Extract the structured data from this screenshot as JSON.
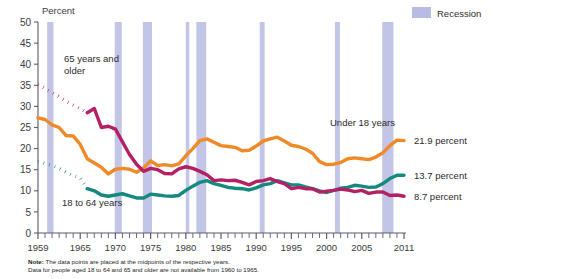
{
  "axis": {
    "ylabel": "Percent",
    "yticks": [
      "0",
      "5",
      "10",
      "15",
      "20",
      "25",
      "30",
      "35",
      "40",
      "45",
      "50"
    ],
    "xticks": [
      "1959",
      "1965",
      "1970",
      "1975",
      "1980",
      "1985",
      "1990",
      "1995",
      "2000",
      "2005",
      "2011"
    ],
    "ylim": [
      0,
      50
    ],
    "xlim": [
      1959,
      2011
    ]
  },
  "legend": {
    "recession_label": "Recession",
    "recession_color": "#b9bbe2"
  },
  "series_labels": {
    "older": "65 years and\nolder",
    "older_line1": "65 years and",
    "older_line2": "older",
    "under18": "Under 18 years",
    "adults": "18 to 64 years"
  },
  "end_values": {
    "under18": "21.9 percent",
    "adults": "13.7 percent",
    "older": "8.7 percent"
  },
  "colors": {
    "under18": "#f08a26",
    "adults": "#14897f",
    "older": "#b32064",
    "recession": "#b9bbe2",
    "axis": "#5a5a6e"
  },
  "note": {
    "label": "Note:",
    "line1": "The data  points are  placed  at the midpoints of the respective years.",
    "line2": "Data for people aged 18 to 64 and 65 and older are not available from 1960 to 1965."
  },
  "chart_data": {
    "type": "line",
    "title": "",
    "xlabel": "",
    "ylabel": "Percent",
    "ylim": [
      0,
      50
    ],
    "xlim": [
      1959,
      2011
    ],
    "grid": false,
    "legend_position": "top-right",
    "x": [
      1959,
      1960,
      1961,
      1962,
      1963,
      1964,
      1965,
      1966,
      1967,
      1968,
      1969,
      1970,
      1971,
      1972,
      1973,
      1974,
      1975,
      1976,
      1977,
      1978,
      1979,
      1980,
      1981,
      1982,
      1983,
      1984,
      1985,
      1986,
      1987,
      1988,
      1989,
      1990,
      1991,
      1992,
      1993,
      1994,
      1995,
      1996,
      1997,
      1998,
      1999,
      2000,
      2001,
      2002,
      2003,
      2004,
      2005,
      2006,
      2007,
      2008,
      2009,
      2010,
      2011
    ],
    "series": [
      {
        "name": "Under 18 years",
        "color": "#f08a26",
        "style": "solid",
        "values": [
          27.3,
          26.9,
          25.6,
          25.0,
          23.1,
          23.0,
          21.0,
          17.6,
          16.6,
          15.6,
          14.0,
          15.1,
          15.3,
          15.1,
          14.4,
          15.4,
          17.1,
          16.0,
          16.2,
          15.9,
          16.4,
          18.3,
          20.0,
          21.9,
          22.3,
          21.5,
          20.7,
          20.5,
          20.3,
          19.5,
          19.6,
          20.6,
          21.8,
          22.3,
          22.7,
          21.8,
          20.8,
          20.5,
          19.9,
          18.9,
          16.9,
          16.2,
          16.3,
          16.7,
          17.6,
          17.8,
          17.6,
          17.4,
          18.0,
          19.0,
          20.7,
          22.0,
          21.9
        ]
      },
      {
        "name": "18 to 64 years",
        "color": "#14897f",
        "style": "dotted-then-solid",
        "dotted_range": [
          1959,
          1966
        ],
        "values": [
          17.0,
          16.5,
          16.0,
          15.3,
          14.4,
          13.6,
          13.1,
          10.5,
          10.0,
          9.0,
          8.7,
          9.0,
          9.3,
          8.8,
          8.3,
          8.3,
          9.2,
          9.0,
          8.8,
          8.7,
          8.9,
          10.1,
          11.1,
          12.0,
          12.4,
          11.7,
          11.3,
          10.8,
          10.6,
          10.5,
          10.2,
          10.7,
          11.4,
          11.7,
          12.4,
          11.9,
          11.4,
          11.4,
          10.9,
          10.5,
          10.0,
          9.6,
          10.1,
          10.6,
          10.8,
          11.3,
          11.1,
          10.8,
          10.9,
          11.7,
          12.9,
          13.7,
          13.7
        ]
      },
      {
        "name": "65 years and older",
        "color": "#b32064",
        "style": "dotted-then-solid",
        "dotted_range": [
          1959,
          1966
        ],
        "values": [
          35.2,
          34.3,
          33.3,
          32.3,
          31.2,
          30.3,
          29.5,
          28.5,
          29.5,
          25.0,
          25.3,
          24.6,
          21.6,
          18.6,
          16.3,
          14.6,
          15.3,
          15.0,
          14.1,
          14.0,
          15.2,
          15.7,
          15.3,
          14.6,
          13.8,
          12.4,
          12.6,
          12.4,
          12.5,
          12.0,
          11.4,
          12.2,
          12.4,
          12.9,
          12.2,
          11.7,
          10.5,
          10.8,
          10.5,
          10.5,
          9.7,
          9.9,
          10.1,
          10.4,
          10.2,
          9.8,
          10.1,
          9.4,
          9.7,
          9.7,
          8.9,
          9.0,
          8.7
        ]
      }
    ],
    "recessions": [
      {
        "start": 1960.3,
        "end": 1961.2
      },
      {
        "start": 1969.9,
        "end": 1970.9
      },
      {
        "start": 1973.9,
        "end": 1975.2
      },
      {
        "start": 1980.0,
        "end": 1980.5
      },
      {
        "start": 1981.5,
        "end": 1982.9
      },
      {
        "start": 1990.5,
        "end": 1991.2
      },
      {
        "start": 2001.2,
        "end": 2001.9
      },
      {
        "start": 2007.9,
        "end": 2009.5
      }
    ],
    "end_annotations": [
      {
        "series": "Under 18 years",
        "text": "21.9 percent"
      },
      {
        "series": "18 to 64 years",
        "text": "13.7 percent"
      },
      {
        "series": "65 years and older",
        "text": "8.7 percent"
      }
    ]
  }
}
